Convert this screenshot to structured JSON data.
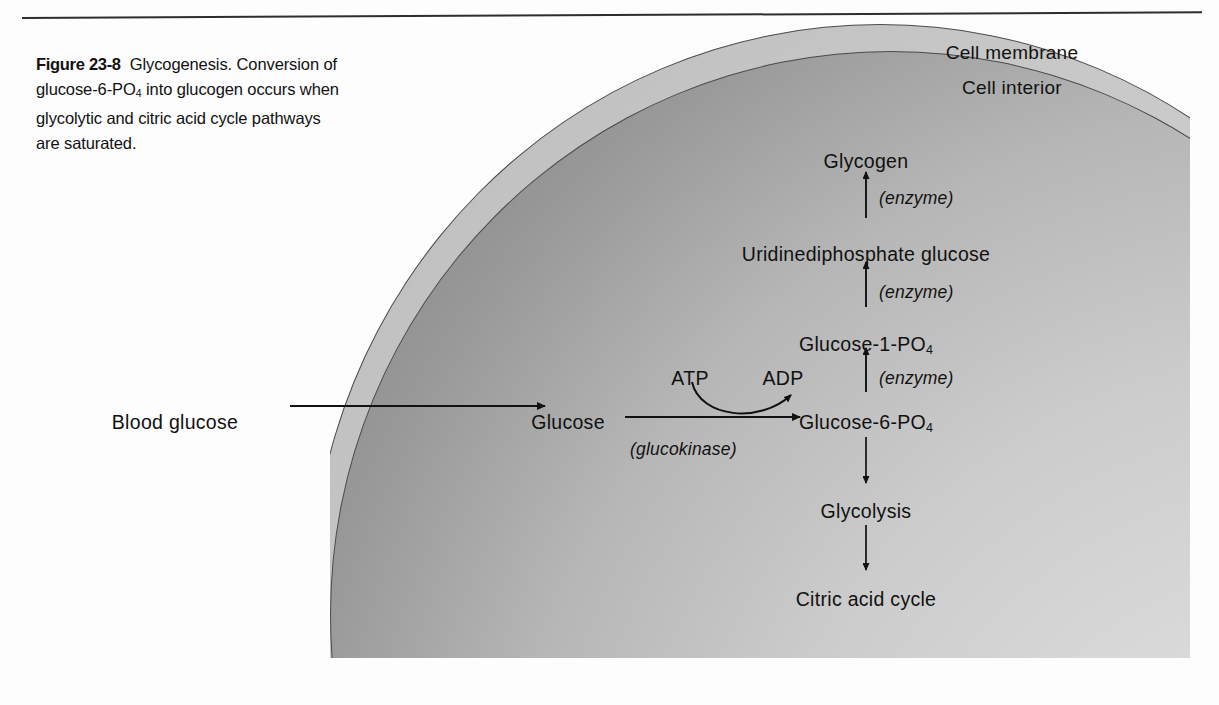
{
  "figure": {
    "number": "Figure 23-8",
    "caption_text": "Glycogenesis. Conversion of glucose-6-PO",
    "caption_sub": "4",
    "caption_text2": " into glucogen occurs when glycolytic and citric acid cycle pathways are saturated."
  },
  "cell": {
    "membrane_label": "Cell membrane",
    "interior_label": "Cell interior",
    "membrane_color": "#c4c4c4",
    "interior_color": "#b0b0b0",
    "outline_color": "#4a4a4a"
  },
  "pathway": {
    "blood_glucose": "Blood glucose",
    "glucose": "Glucose",
    "atp": "ATP",
    "adp": "ADP",
    "glucokinase": "(glucokinase)",
    "glucose_6_po4": "Glucose-6-PO",
    "glucose_6_po4_sub": "4",
    "glucose_1_po4": "Glucose-1-PO",
    "glucose_1_po4_sub": "4",
    "udp_glucose": "Uridinediphosphate glucose",
    "glycogen": "Glycogen",
    "glycolysis": "Glycolysis",
    "citric_acid_cycle": "Citric acid cycle",
    "enzyme_1": "(enzyme)",
    "enzyme_2": "(enzyme)",
    "enzyme_3": "(enzyme)"
  },
  "colors": {
    "text": "#111111",
    "arrow": "#111111",
    "rule": "#2e2e2e",
    "page_background": "#fdfdfd"
  }
}
